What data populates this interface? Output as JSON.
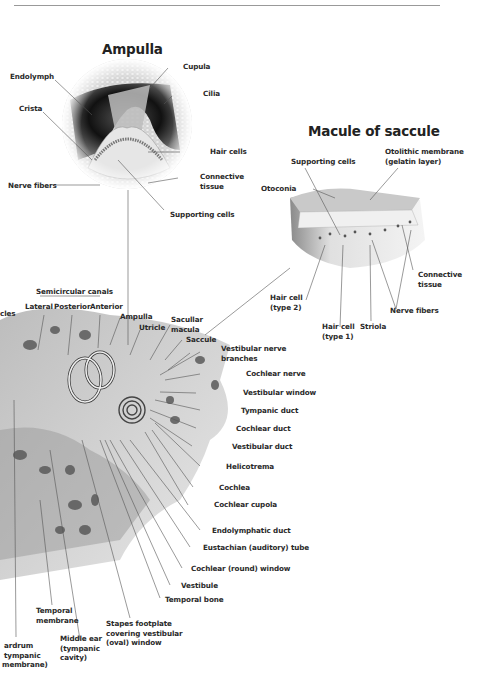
{
  "diagram": {
    "header_fragment": "",
    "ampulla": {
      "title": "Ampulla",
      "labels": {
        "endolymph": "Endolymph",
        "crista": "Crista",
        "cupula": "Cupula",
        "cilia": "Cilia",
        "hair_cells": "Hair cells",
        "connective_tissue_1": "Connective",
        "connective_tissue_2": "tissue",
        "nerve_fibers": "Nerve fibers",
        "supporting_cells": "Supporting cells"
      }
    },
    "macule": {
      "title": "Macule of saccule",
      "labels": {
        "supporting_cells": "Supporting cells",
        "otolithic_1": "Otolithic membrane",
        "otolithic_2": "(gelatin layer)",
        "otoconia": "Otoconia",
        "connective_1": "Connective",
        "connective_2": "tissue",
        "nerve_fibers": "Nerve fibers",
        "hair2_1": "Hair cell",
        "hair2_2": "(type 2)",
        "hair1_1": "Hair cell",
        "hair1_2": "(type 1)",
        "striola": "Striola"
      }
    },
    "inner_ear": {
      "labels": {
        "ossicles_fragment": "cles",
        "semicircular_canals": "Semicircular canals",
        "lateral": "Lateral",
        "posterior": "Posterior",
        "anterior": "Anterior",
        "ampulla": "Ampulla",
        "utricle": "Utricle",
        "saccular_1": "Sacullar",
        "saccular_2": "macula",
        "saccule": "Saccule",
        "vestibular_nerve_1": "Vestibular nerve",
        "vestibular_nerve_2": "branches",
        "cochlear_nerve": "Cochlear nerve",
        "vestibular_window": "Vestibular window",
        "tympanic_duct": "Tympanic duct",
        "cochlear_duct": "Cochlear duct",
        "vestibular_duct": "Vestibular duct",
        "helicotrema": "Helicotrema",
        "cochlea": "Cochlea",
        "cochlear_cupola": "Cochlear cupola",
        "endolymphatic_duct": "Endolymphatic duct",
        "eustachian_tube": "Eustachian (auditory) tube",
        "cochlear_window": "Cochlear (round) window",
        "vestibule": "Vestibule",
        "temporal_bone": "Temporal bone",
        "temporal_membrane_1": "Temporal",
        "temporal_membrane_2": "membrane",
        "stapes_1": "Stapes footplate",
        "stapes_2": "covering vestibular",
        "stapes_3": "(oval) window",
        "middle_ear_1": "Middle ear",
        "middle_ear_2": "(tympanic",
        "middle_ear_3": "cavity)",
        "eardrum_1": "ardrum",
        "eardrum_2": "tympanic",
        "eardrum_3": "membrane)"
      }
    }
  }
}
